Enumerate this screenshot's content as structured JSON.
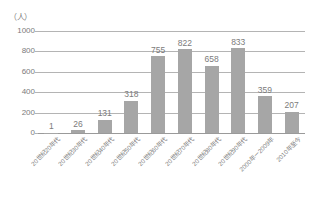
{
  "chart_data": {
    "type": "bar",
    "title": "",
    "subtitle": "",
    "xlabel": "",
    "ylabel": "（人）",
    "unit_label": "（人）",
    "categories": [
      "20世纪20年代",
      "20世纪30年代",
      "20世纪40年代",
      "20世纪50年代",
      "20世纪60年代",
      "20世纪70年代",
      "20世纪80年代",
      "20世纪90年代",
      "2000年－2009年",
      "2010年至今"
    ],
    "values": [
      1,
      26,
      131,
      318,
      755,
      822,
      658,
      833,
      359,
      207
    ],
    "data_labels": [
      "1",
      "26",
      "131",
      "318",
      "755",
      "822",
      "658",
      "833",
      "359",
      "207"
    ],
    "ylim": [
      0,
      1000
    ],
    "yticks": [
      0,
      200,
      400,
      600,
      800,
      1000
    ],
    "ytick_labels": [
      "0",
      "200",
      "400",
      "600",
      "800",
      "1000"
    ],
    "grid": "horizontal",
    "legend": "none",
    "bar_color": "#a6a6a6",
    "gridline_color": "#b4b4b4",
    "text_color": "#7b7b7b",
    "background_color": "#ffffff"
  }
}
